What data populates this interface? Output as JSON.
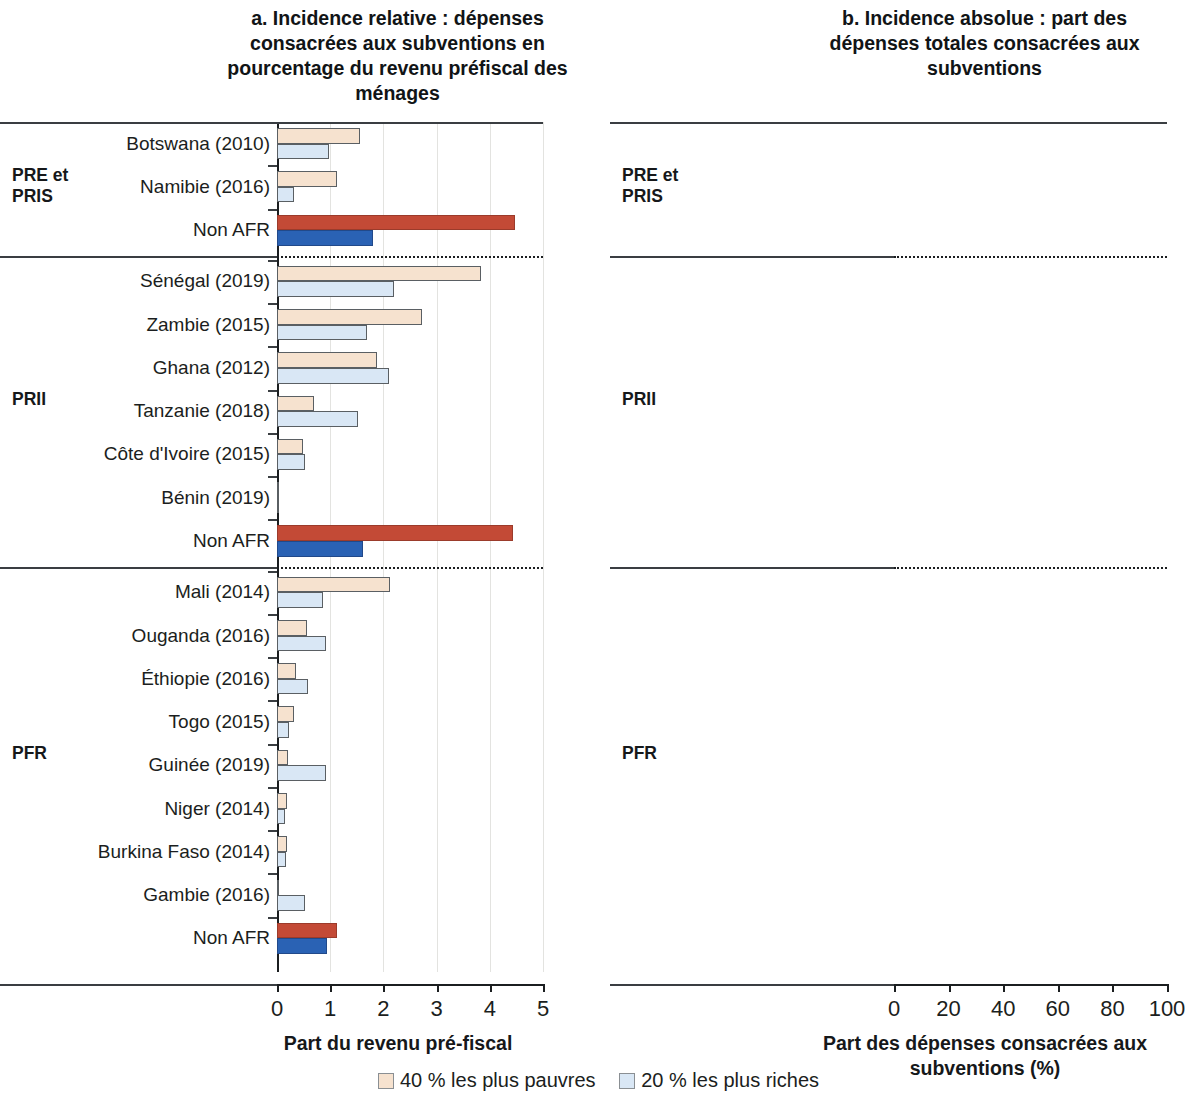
{
  "panels": {
    "a": {
      "title": "a. Incidence relative : dépenses consacrées aux subventions en pourcentage du revenu préfiscal des ménages",
      "axis_title": "Part du revenu pré-fiscal",
      "xticks": [
        "0",
        "1",
        "2",
        "3",
        "4",
        "5"
      ]
    },
    "b": {
      "title": "b. Incidence absolue : part des dépenses totales consacrées aux subventions",
      "axis_title": "Part des dépenses consacrées aux subventions (%)",
      "xticks": [
        "0",
        "20",
        "40",
        "60",
        "80",
        "100"
      ]
    }
  },
  "groups": [
    {
      "label": "PRE et\nPRIS",
      "label_line1": "PRE et",
      "label_line2": "PRIS"
    },
    {
      "label": "PRII",
      "label_line1": "PRII",
      "label_line2": ""
    },
    {
      "label": "PFR",
      "label_line1": "PFR",
      "label_line2": ""
    }
  ],
  "legend": [
    {
      "label": "40 % les plus pauvres",
      "color": "#f6e2cf",
      "key": "poor"
    },
    {
      "label": "20 % les plus riches",
      "color": "#d9e7f5",
      "key": "rich"
    }
  ],
  "colors": {
    "poor": "#f6e2cf",
    "rich": "#d9e7f5",
    "poor_highlight": "#c34a36",
    "rich_highlight": "#2a62b4",
    "axis": "#1b1e20",
    "grid": "#e3e3e0"
  },
  "chart_data": {
    "type": "bar",
    "orientation": "horizontal",
    "grid": true,
    "legend_position": "bottom",
    "series": [
      {
        "name": "40 % les plus pauvres",
        "key": "poor",
        "color": "#f6e2cf"
      },
      {
        "name": "20 % les plus riches",
        "key": "rich",
        "color": "#d9e7f5"
      }
    ],
    "panels": [
      {
        "id": "a",
        "title": "a. Incidence relative : dépenses consacrées aux subventions en pourcentage du revenu préfiscal des ménages",
        "xlabel": "Part du revenu pré-fiscal",
        "ylabel": "",
        "xlim": [
          0,
          5
        ],
        "xticks": [
          0,
          1,
          2,
          3,
          4,
          5
        ],
        "bar_mode": "from-zero"
      },
      {
        "id": "b",
        "title": "b. Incidence absolue : part des dépenses totales consacrées aux subventions",
        "xlabel": "Part des dépenses consacrées aux subventions (%)",
        "ylabel": "",
        "xlim": [
          0,
          100
        ],
        "xticks": [
          0,
          20,
          40,
          60,
          80,
          100
        ],
        "bar_mode": "poor-from-zero, rich-right-anchored-at-100"
      }
    ],
    "groups": [
      {
        "name": "PRE et PRIS",
        "rows": [
          {
            "country": "Botswana (2010)",
            "highlight": false,
            "a_poor": 1.56,
            "a_rich": 0.98,
            "b_poor": 10.6,
            "b_rich": 56.0,
            "b_rich_start": 44.0,
            "b_rich_end": 100
          },
          {
            "country": "Namibie (2016)",
            "highlight": false,
            "a_poor": 1.13,
            "a_rich": 0.32,
            "b_poor": 17.0,
            "b_rich": 45.0,
            "b_rich_start": 55.0,
            "b_rich_end": 100
          },
          {
            "country": "Non AFR",
            "highlight": true,
            "a_poor": 4.47,
            "a_rich": 1.8,
            "b_poor": 35.5,
            "b_rich": 28.6,
            "b_rich_start": 71.4,
            "b_rich_end": 100
          }
        ]
      },
      {
        "name": "PRII",
        "rows": [
          {
            "country": "Sénégal (2019)",
            "highlight": false,
            "a_poor": 3.83,
            "a_rich": 2.2,
            "b_poor": 24.0,
            "b_rich": 39.0,
            "b_rich_start": 61.0,
            "b_rich_end": 100
          },
          {
            "country": "Zambie (2015)",
            "highlight": false,
            "a_poor": 2.72,
            "a_rich": 1.69,
            "b_poor": 14.0,
            "b_rich": 60.0,
            "b_rich_start": 40.0,
            "b_rich_end": 100
          },
          {
            "country": "Ghana (2012)",
            "highlight": false,
            "a_poor": 1.88,
            "a_rich": 2.1,
            "b_poor": 13.5,
            "b_rich": 49.0,
            "b_rich_start": 51.0,
            "b_rich_end": 100
          },
          {
            "country": "Tanzanie (2018)",
            "highlight": false,
            "a_poor": 0.69,
            "a_rich": 1.52,
            "b_poor": 9.0,
            "b_rich": 59.5,
            "b_rich_start": 40.5,
            "b_rich_end": 100
          },
          {
            "country": "Côte d'Ivoire (2015)",
            "highlight": false,
            "a_poor": 0.49,
            "a_rich": 0.53,
            "b_poor": 16.0,
            "b_rich": 47.0,
            "b_rich_start": 53.0,
            "b_rich_end": 100
          },
          {
            "country": "Bénin (2019)",
            "highlight": false,
            "a_poor": 0.04,
            "a_rich": 0.04,
            "b_poor": 17.0,
            "b_rich": 48.0,
            "b_rich_start": 52.0,
            "b_rich_end": 100
          },
          {
            "country": "Non AFR",
            "highlight": true,
            "a_poor": 4.43,
            "a_rich": 1.61,
            "b_poor": 25.0,
            "b_rich": 34.5,
            "b_rich_start": 65.5,
            "b_rich_end": 100
          }
        ]
      },
      {
        "name": "PFR",
        "rows": [
          {
            "country": "Mali (2014)",
            "highlight": false,
            "a_poor": 2.12,
            "a_rich": 0.86,
            "b_poor": 26.7,
            "b_rich": 42.5,
            "b_rich_start": 57.5,
            "b_rich_end": 100
          },
          {
            "country": "Ouganda (2016)",
            "highlight": false,
            "a_poor": 0.56,
            "a_rich": 0.92,
            "b_poor": 10.6,
            "b_rich": 58.2,
            "b_rich_start": 41.8,
            "b_rich_end": 100
          },
          {
            "country": "Éthiopie (2016)",
            "highlight": false,
            "a_poor": 0.36,
            "a_rich": 0.58,
            "b_poor": 15.0,
            "b_rich": 51.3,
            "b_rich_start": 48.7,
            "b_rich_end": 100
          },
          {
            "country": "Togo (2015)",
            "highlight": false,
            "a_poor": 0.32,
            "a_rich": 0.23,
            "b_poor": 17.5,
            "b_rich": 46.5,
            "b_rich_start": 53.5,
            "b_rich_end": 100
          },
          {
            "country": "Guinée (2019)",
            "highlight": false,
            "a_poor": 0.21,
            "a_rich": 0.92,
            "b_poor": 8.7,
            "b_rich": 52.0,
            "b_rich_start": 48.0,
            "b_rich_end": 100
          },
          {
            "country": "Niger (2014)",
            "highlight": false,
            "a_poor": 0.19,
            "a_rich": 0.15,
            "b_poor": 19.4,
            "b_rich": 33.0,
            "b_rich_start": 67.0,
            "b_rich_end": 100
          },
          {
            "country": "Burkina Faso (2014)",
            "highlight": false,
            "a_poor": 0.19,
            "a_rich": 0.17,
            "b_poor": 19.5,
            "b_rich": 33.0,
            "b_rich_start": 67.0,
            "b_rich_end": 100
          },
          {
            "country": "Gambie (2016)",
            "highlight": false,
            "a_poor": 0.01,
            "a_rich": 0.53,
            "b_poor": 0.8,
            "b_rich": 92.7,
            "b_rich_start": 7.3,
            "b_rich_end": 100
          },
          {
            "country": "Non AFR",
            "highlight": true,
            "a_poor": 1.12,
            "a_rich": 0.94,
            "b_poor": 22.7,
            "b_rich": 39.5,
            "b_rich_start": 60.5,
            "b_rich_end": 100
          }
        ]
      }
    ]
  }
}
